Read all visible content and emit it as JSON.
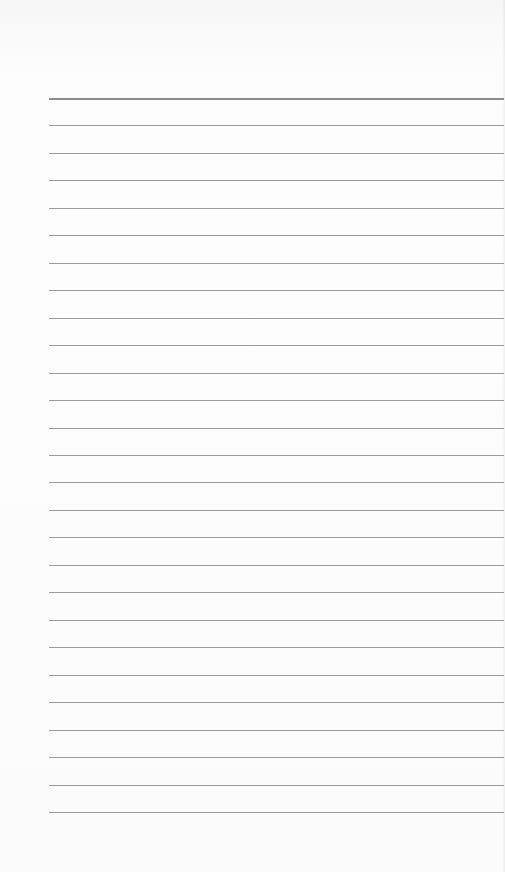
{
  "page": {
    "type": "lined-paper",
    "background_color": "#fdfdfd",
    "line_color": "#9a9a9a",
    "line_count": 27,
    "first_line_y": 98,
    "line_spacing": 27.46,
    "line_left_x": 49,
    "text_content": []
  }
}
